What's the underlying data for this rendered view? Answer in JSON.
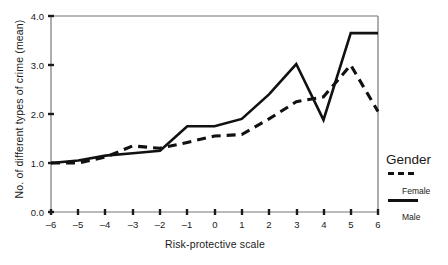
{
  "chart_data": {
    "type": "line",
    "title": "",
    "xlabel": "Risk-protective scale",
    "ylabel": "No. of different types of crime (mean)",
    "x": [
      -6,
      -5,
      -4,
      -3,
      -2,
      -1,
      0,
      1,
      2,
      3,
      4,
      5,
      6
    ],
    "xticklabels": [
      "–6",
      "–5",
      "–4",
      "–3",
      "–2",
      "–1",
      "0",
      "1",
      "2",
      "3",
      "4",
      "5",
      "6"
    ],
    "yticklabels": [
      "0.0",
      "1.0",
      "2.0",
      "3.0",
      "4.0"
    ],
    "yticks": [
      0.0,
      1.0,
      2.0,
      3.0,
      4.0
    ],
    "xlim": [
      -6,
      6
    ],
    "ylim": [
      0.0,
      4.0
    ],
    "grid": false,
    "legend": {
      "title": "Gender",
      "position": "right",
      "entries": [
        {
          "name": "Female",
          "style": "dashed"
        },
        {
          "name": "Male",
          "style": "solid"
        }
      ]
    },
    "series": [
      {
        "name": "Female",
        "style": "dashed",
        "color": "#111111",
        "values": [
          1.0,
          1.0,
          1.12,
          1.35,
          1.3,
          1.42,
          1.55,
          1.58,
          1.9,
          2.25,
          2.35,
          3.0,
          2.05
        ]
      },
      {
        "name": "Male",
        "style": "solid",
        "color": "#111111",
        "values": [
          1.0,
          1.05,
          1.15,
          1.2,
          1.25,
          1.75,
          1.75,
          1.9,
          2.4,
          3.02,
          1.88,
          3.65,
          3.65
        ]
      }
    ]
  },
  "axes": {
    "x_title": "Risk-protective scale",
    "y_title": "No. of different types of crime (mean)"
  },
  "legend": {
    "title": "Gender",
    "female_label": "Female",
    "male_label": "Male"
  }
}
